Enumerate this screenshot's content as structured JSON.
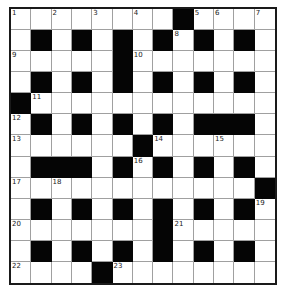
{
  "puzzle": {
    "rows": 13,
    "cols": 13,
    "colors": {
      "black": "#050505",
      "white": "#ffffff",
      "gridline": "#a0a0a0",
      "border": "#1a1a1a"
    },
    "layout": [
      "........#....",
      ".#.#.#.#.#.#.",
      ".....#.......",
      ".#.#.#.#.#.#.",
      "#............",
      ".#.#.#.#.###.",
      "......#......",
      ".###.#.#.#.#.",
      "............#",
      ".#.#.#.#.#.#.",
      ".......#.....",
      ".#.#.#.#.#.#.",
      "....#........"
    ],
    "numbers": [
      {
        "row": 0,
        "col": 0,
        "n": "1"
      },
      {
        "row": 0,
        "col": 2,
        "n": "2"
      },
      {
        "row": 0,
        "col": 4,
        "n": "3"
      },
      {
        "row": 0,
        "col": 6,
        "n": "4"
      },
      {
        "row": 0,
        "col": 9,
        "n": "5"
      },
      {
        "row": 0,
        "col": 10,
        "n": "6"
      },
      {
        "row": 0,
        "col": 12,
        "n": "7"
      },
      {
        "row": 1,
        "col": 8,
        "n": "8"
      },
      {
        "row": 2,
        "col": 0,
        "n": "9"
      },
      {
        "row": 2,
        "col": 6,
        "n": "10"
      },
      {
        "row": 4,
        "col": 1,
        "n": "11"
      },
      {
        "row": 5,
        "col": 0,
        "n": "12"
      },
      {
        "row": 6,
        "col": 0,
        "n": "13"
      },
      {
        "row": 6,
        "col": 7,
        "n": "14"
      },
      {
        "row": 6,
        "col": 10,
        "n": "15"
      },
      {
        "row": 7,
        "col": 6,
        "n": "16"
      },
      {
        "row": 8,
        "col": 0,
        "n": "17"
      },
      {
        "row": 8,
        "col": 2,
        "n": "18"
      },
      {
        "row": 9,
        "col": 12,
        "n": "19"
      },
      {
        "row": 10,
        "col": 0,
        "n": "20"
      },
      {
        "row": 10,
        "col": 8,
        "n": "21"
      },
      {
        "row": 12,
        "col": 0,
        "n": "22"
      },
      {
        "row": 12,
        "col": 5,
        "n": "23"
      }
    ]
  }
}
